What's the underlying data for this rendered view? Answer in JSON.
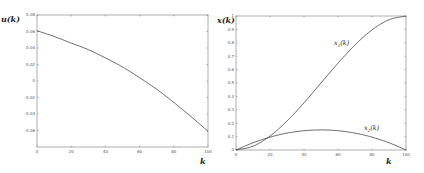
{
  "chart_data": [
    {
      "type": "line",
      "title": "",
      "xlabel": "k",
      "ylabel": "u(k)",
      "xlim": [
        0,
        100
      ],
      "ylim": [
        -0.08,
        0.08
      ],
      "xticks": [
        "0",
        "20",
        "40",
        "60",
        "80",
        "100"
      ],
      "yticks": [
        "0.08",
        "0.06",
        "0.04",
        "0.02",
        "0",
        "-0.02",
        "-0.04",
        "-0.06"
      ],
      "grid": false,
      "series": [
        {
          "name": "u(k)",
          "x": [
            0,
            10,
            20,
            30,
            40,
            50,
            60,
            70,
            80,
            90,
            100
          ],
          "values": [
            0.061,
            0.054,
            0.046,
            0.038,
            0.028,
            0.017,
            0.004,
            -0.01,
            -0.026,
            -0.043,
            -0.061
          ]
        }
      ]
    },
    {
      "type": "line",
      "title": "",
      "xlabel": "k",
      "ylabel": "x(k)",
      "xlim": [
        0,
        100
      ],
      "ylim": [
        0,
        1
      ],
      "xticks": [
        "0",
        "20",
        "40",
        "60",
        "80",
        "100"
      ],
      "yticks": [
        "1",
        "0.9",
        "0.8",
        "0.7",
        "0.6",
        "0.5",
        "0.4",
        "0.3",
        "0.2",
        "0.1",
        "0"
      ],
      "grid": false,
      "annotations": [
        "x1(k)",
        "x2(k)"
      ],
      "series": [
        {
          "name": "x1(k)",
          "x": [
            0,
            10,
            20,
            30,
            40,
            50,
            60,
            70,
            80,
            90,
            100
          ],
          "values": [
            0.0,
            0.028,
            0.104,
            0.216,
            0.352,
            0.5,
            0.648,
            0.784,
            0.896,
            0.972,
            1.0
          ]
        },
        {
          "name": "x2(k)",
          "x": [
            0,
            10,
            20,
            30,
            40,
            50,
            60,
            70,
            80,
            90,
            100
          ],
          "values": [
            0.0,
            0.054,
            0.096,
            0.126,
            0.144,
            0.15,
            0.144,
            0.126,
            0.096,
            0.054,
            0.0
          ]
        }
      ]
    }
  ],
  "labels": {
    "left_ylabel": "u(k)",
    "right_ylabel": "x(k)",
    "xlabel": "k",
    "x1_label": "x",
    "x1_sub": "1",
    "x2_label": "x",
    "x2_sub": "2",
    "k_suffix": "(k)"
  }
}
